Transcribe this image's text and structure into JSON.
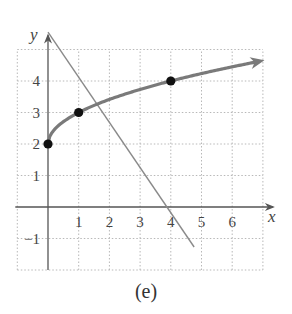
{
  "chart_data": {
    "type": "line",
    "title": "",
    "caption": "(e)",
    "xlabel": "x",
    "ylabel": "y",
    "xlim": [
      -1,
      7
    ],
    "ylim": [
      -2,
      5
    ],
    "grid": true,
    "grid_style": "dotted",
    "x_ticks": [
      1,
      2,
      3,
      4,
      5,
      6
    ],
    "x_tick_labels": [
      "1",
      "2",
      "3",
      "4",
      "5",
      "6"
    ],
    "y_ticks": [
      -1,
      1,
      2,
      3,
      4
    ],
    "y_tick_labels": [
      "−1",
      "1",
      "2",
      "3",
      "4"
    ],
    "series": [
      {
        "name": "curve y = 2 + √x",
        "kind": "curve-with-arrow",
        "color": "#7a7a7a",
        "x": [
          0,
          1,
          4,
          7
        ],
        "y": [
          2,
          3,
          4,
          4.65
        ],
        "marked_points": [
          [
            0,
            2
          ],
          [
            1,
            3
          ],
          [
            4,
            4
          ]
        ]
      },
      {
        "name": "straight line",
        "kind": "line-segment",
        "color": "#8a8a8a",
        "x": [
          0,
          4.76
        ],
        "y": [
          5.55,
          -1.27
        ]
      }
    ]
  }
}
